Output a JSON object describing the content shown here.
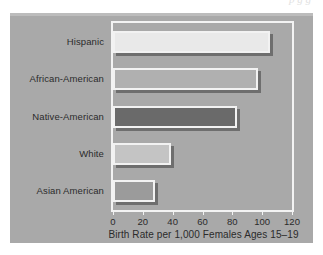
{
  "page": {
    "bleed_text": "p            g g"
  },
  "chart_data": {
    "type": "bar",
    "orientation": "horizontal",
    "title": "",
    "xlabel": "Birth Rate per 1,000 Females Ages 15–19",
    "ylabel": "",
    "categories": [
      "Hispanic",
      "African-American",
      "Native-American",
      "White",
      "Asian American"
    ],
    "values": [
      105,
      97,
      83,
      39,
      28
    ],
    "xlim": [
      0,
      120
    ],
    "xticks": [
      0,
      20,
      40,
      60,
      80,
      100,
      120
    ],
    "xtick_labels": [
      "0",
      "20",
      "40",
      "60",
      "80",
      "100",
      "120"
    ],
    "grid": false,
    "legend": "none",
    "bar_colors": [
      "#e9e9e9",
      "#b0b0b0",
      "#6a6a6a",
      "#c4c4c4",
      "#9b9b9b"
    ],
    "bar_border_color": "#f2f2f2",
    "bar_shadow_color": "#6e6e6e",
    "panel_color": "#a9a9a9",
    "frame_color": "#f3f3f3",
    "text_color": "#2b2b2b"
  }
}
